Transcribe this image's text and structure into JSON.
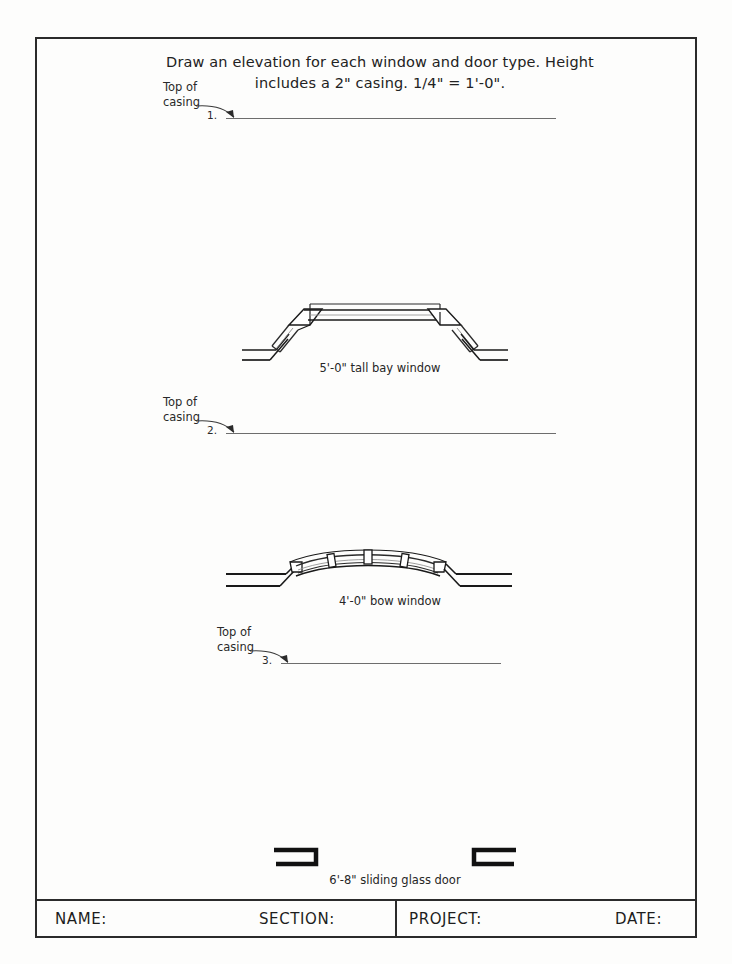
{
  "page": {
    "background_color": "#fdfdfc",
    "border_color": "#2b2b2b"
  },
  "instruction": {
    "line1": "Draw an elevation for each window and door type. Height",
    "line2": "includes a 2\" casing. 1/4\" = 1'-0\"."
  },
  "tasks": [
    {
      "number": "1.",
      "callout_line1": "Top of",
      "callout_line2": "casing",
      "rule_label": "baseline-rule-1"
    },
    {
      "number": "2.",
      "callout_line1": "Top of",
      "callout_line2": "casing",
      "rule_label": "baseline-rule-2"
    },
    {
      "number": "3.",
      "callout_line1": "Top of",
      "callout_line2": "casing",
      "rule_label": "baseline-rule-3"
    }
  ],
  "figures": [
    {
      "name": "bay-window",
      "caption": "5'-0\" tall bay window"
    },
    {
      "name": "bow-window",
      "caption": "4'-0\" bow window"
    },
    {
      "name": "sliding-glass-door",
      "caption": "6'-8\" sliding glass door"
    }
  ],
  "title_block": {
    "name_label": "NAME:",
    "section_label": "SECTION:",
    "project_label": "PROJECT:",
    "date_label": "DATE:"
  }
}
